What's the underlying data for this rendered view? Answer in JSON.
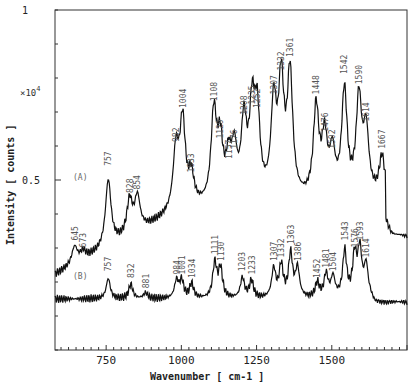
{
  "chart_data": {
    "type": "line",
    "title": "",
    "xlabel": "Wavenumber [ cm-1 ]",
    "ylabel": "Intensity [ counts ]",
    "y_multiplier": "x10^4",
    "y_multiplier_display": "×10",
    "y_multiplier_exp": "4",
    "xlim": [
      580,
      1750
    ],
    "ylim": [
      0,
      1
    ],
    "x_ticks": [
      750,
      1000,
      1250,
      1500
    ],
    "x_tick_labels": [
      "750",
      "1000",
      "1250",
      "1500"
    ],
    "y_tick_labels": [
      {
        "value": 1,
        "label": "1"
      },
      {
        "value": 0.5,
        "label": "0.5"
      }
    ],
    "grid": false,
    "legend": "none (series labelled inline)",
    "series": [
      {
        "name": "(A)",
        "label_position": {
          "wavenumber": 640,
          "y": 0.5
        },
        "peaks": [
          {
            "x": 645,
            "label": "645",
            "y": 0.31
          },
          {
            "x": 673,
            "label": "673",
            "y": 0.29
          },
          {
            "x": 757,
            "label": "757",
            "y": 0.53
          },
          {
            "x": 828,
            "label": "828",
            "y": 0.45
          },
          {
            "x": 854,
            "label": "854",
            "y": 0.46
          },
          {
            "x": 982,
            "label": "982",
            "y": 0.6
          },
          {
            "x": 1004,
            "label": "1004",
            "y": 0.7
          },
          {
            "x": 1033,
            "label": "1033",
            "y": 0.51
          },
          {
            "x": 1108,
            "label": "1108",
            "y": 0.72
          },
          {
            "x": 1129,
            "label": "1129",
            "y": 0.61
          },
          {
            "x": 1157,
            "label": "1157",
            "y": 0.55
          },
          {
            "x": 1176,
            "label": "1176",
            "y": 0.58
          },
          {
            "x": 1208,
            "label": "1208",
            "y": 0.68
          },
          {
            "x": 1235,
            "label": "1235",
            "y": 0.71
          },
          {
            "x": 1252,
            "label": "1252",
            "y": 0.7
          },
          {
            "x": 1307,
            "label": "1307",
            "y": 0.74
          },
          {
            "x": 1332,
            "label": "1332",
            "y": 0.81
          },
          {
            "x": 1361,
            "label": "1361",
            "y": 0.85
          },
          {
            "x": 1448,
            "label": "1448",
            "y": 0.74
          },
          {
            "x": 1476,
            "label": "1476",
            "y": 0.63
          },
          {
            "x": 1502,
            "label": "1502",
            "y": 0.58
          },
          {
            "x": 1542,
            "label": "1542",
            "y": 0.8
          },
          {
            "x": 1590,
            "label": "1590",
            "y": 0.77
          },
          {
            "x": 1614,
            "label": "1614",
            "y": 0.66
          },
          {
            "x": 1667,
            "label": "1667",
            "y": 0.58
          }
        ]
      },
      {
        "name": "(B)",
        "label_position": {
          "wavenumber": 640,
          "y": 0.21
        },
        "peaks": [
          {
            "x": 757,
            "label": "757",
            "y": 0.22
          },
          {
            "x": 832,
            "label": "832",
            "y": 0.2
          },
          {
            "x": 881,
            "label": "881",
            "y": 0.17
          },
          {
            "x": 984,
            "label": "984",
            "y": 0.21
          },
          {
            "x": 1001,
            "label": "1001",
            "y": 0.21
          },
          {
            "x": 1034,
            "label": "1034",
            "y": 0.2
          },
          {
            "x": 1111,
            "label": "1111",
            "y": 0.27
          },
          {
            "x": 1130,
            "label": "1130",
            "y": 0.25
          },
          {
            "x": 1203,
            "label": "1203",
            "y": 0.22
          },
          {
            "x": 1233,
            "label": "1233",
            "y": 0.21
          },
          {
            "x": 1307,
            "label": "1307",
            "y": 0.25
          },
          {
            "x": 1332,
            "label": "1332",
            "y": 0.26
          },
          {
            "x": 1363,
            "label": "1363",
            "y": 0.3
          },
          {
            "x": 1386,
            "label": "1386",
            "y": 0.25
          },
          {
            "x": 1452,
            "label": "1452",
            "y": 0.2
          },
          {
            "x": 1481,
            "label": "1481",
            "y": 0.23
          },
          {
            "x": 1504,
            "label": "1504",
            "y": 0.22
          },
          {
            "x": 1543,
            "label": "1543",
            "y": 0.31
          },
          {
            "x": 1576,
            "label": "1576",
            "y": 0.29
          },
          {
            "x": 1593,
            "label": "1593",
            "y": 0.31
          },
          {
            "x": 1614,
            "label": "1614",
            "y": 0.26
          }
        ]
      }
    ]
  }
}
